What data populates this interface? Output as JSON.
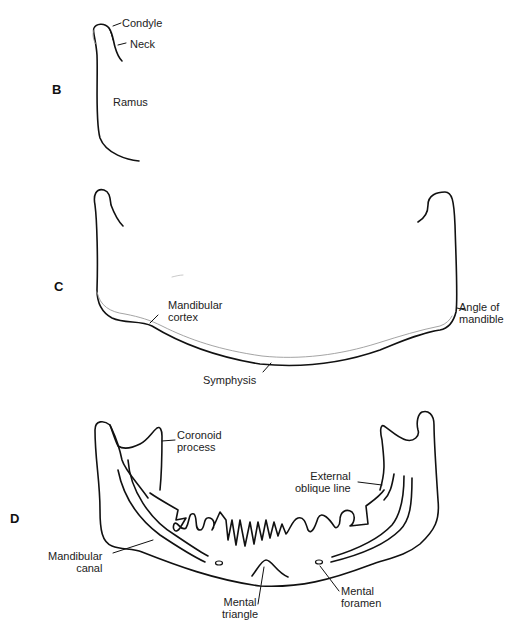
{
  "panels": {
    "B": {
      "letter": "B",
      "labels": {
        "condyle": "Condyle",
        "neck": "Neck",
        "ramus": "Ramus"
      }
    },
    "C": {
      "letter": "C",
      "labels": {
        "mandibular_cortex_1": "Mandibular",
        "mandibular_cortex_2": "cortex",
        "angle_1": "Angle of",
        "angle_2": "mandible",
        "symphysis": "Symphysis"
      }
    },
    "D": {
      "letter": "D",
      "labels": {
        "coronoid_1": "Coronoid",
        "coronoid_2": "process",
        "external_oblique_1": "External",
        "external_oblique_2": "oblique line",
        "mandibular_canal_1": "Mandibular",
        "mandibular_canal_2": "canal",
        "mental_triangle_1": "Mental",
        "mental_triangle_2": "triangle",
        "mental_foramen_1": "Mental",
        "mental_foramen_2": "foramen"
      }
    }
  },
  "colors": {
    "line": "#111111",
    "cortex": "#9a9a9a"
  }
}
